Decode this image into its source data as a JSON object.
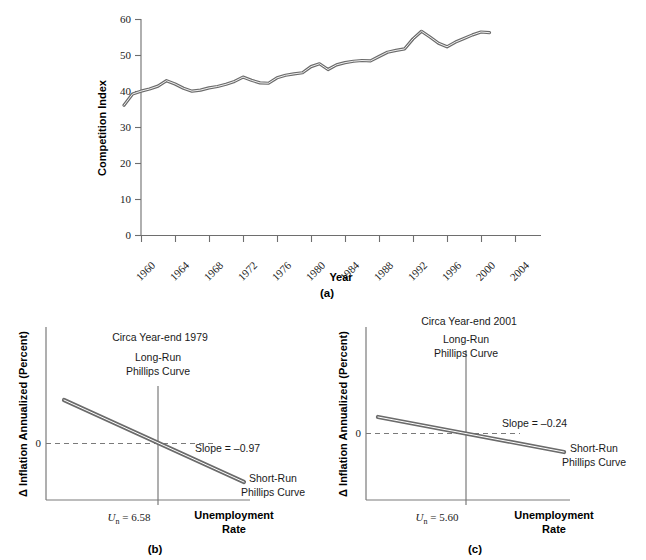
{
  "figure": {
    "panels": [
      {
        "id": "a",
        "label": "(a)"
      },
      {
        "id": "b",
        "label": "(b)"
      },
      {
        "id": "c",
        "label": "(c)"
      }
    ]
  },
  "chart_data": [
    {
      "type": "line",
      "panel": "(a)",
      "title": "",
      "xlabel": "Year",
      "ylabel": "Competition Index",
      "xlim": [
        1958,
        2004
      ],
      "ylim": [
        0,
        60
      ],
      "grid": false,
      "legend": "none",
      "ytick_labels": [
        "0",
        "10",
        "20",
        "30",
        "40",
        "50",
        "60"
      ],
      "yticks": [
        0,
        10,
        20,
        30,
        40,
        50,
        60
      ],
      "xtick_labels": [
        "1960",
        "1964",
        "1968",
        "1972",
        "1976",
        "1980",
        "1984",
        "1988",
        "1992",
        "1996",
        "2000",
        "2004"
      ],
      "xticks": [
        1960,
        1964,
        1968,
        1972,
        1976,
        1980,
        1984,
        1988,
        1992,
        1996,
        2000,
        2004
      ],
      "series": [
        {
          "name": "Competition Index",
          "color": "#6b6b6b",
          "x": [
            1958,
            1959,
            1960,
            1961,
            1962,
            1963,
            1964,
            1965,
            1966,
            1967,
            1968,
            1969,
            1970,
            1971,
            1972,
            1973,
            1974,
            1975,
            1976,
            1977,
            1978,
            1979,
            1980,
            1981,
            1982,
            1983,
            1984,
            1985,
            1986,
            1987,
            1988,
            1989,
            1990,
            1991,
            1992,
            1993,
            1994,
            1995,
            1996,
            1997,
            1998,
            1999,
            2000,
            2001
          ],
          "values": [
            36.1,
            39.2,
            40.0,
            40.6,
            41.4,
            42.9,
            42.0,
            40.8,
            40.0,
            40.3,
            40.9,
            41.3,
            41.9,
            42.7,
            43.9,
            43.0,
            42.3,
            42.2,
            43.7,
            44.4,
            44.8,
            45.1,
            46.8,
            47.6,
            46.0,
            47.3,
            47.9,
            48.3,
            48.5,
            48.4,
            49.6,
            50.8,
            51.3,
            51.7,
            54.5,
            56.6,
            55.0,
            53.3,
            52.3,
            53.6,
            54.6,
            55.6,
            56.4,
            56.2
          ]
        }
      ]
    },
    {
      "type": "line",
      "panel": "(b)",
      "title": "Circa Year-end 1979",
      "xlabel": "Unemployment Rate",
      "ylabel": "Δ Inflation Annualized (Percent)",
      "grid": false,
      "zero_label": "0",
      "lrpc_label_line1": "Long-Run",
      "lrpc_label_line2": "Phillips Curve",
      "srpc_label_line1": "Short-Run",
      "srpc_label_line2": "Phillips Curve",
      "slope_label": "Slope = –0.97",
      "slope_value": -0.97,
      "natural_rate_label": "U",
      "natural_rate_sub": "n",
      "natural_rate_eq": " = 6.58",
      "natural_rate_value": 6.58
    },
    {
      "type": "line",
      "panel": "(c)",
      "title": "Circa Year-end 2001",
      "xlabel": "Unemployment Rate",
      "ylabel": "Δ Inflation Annualized (Percent)",
      "grid": false,
      "zero_label": "0",
      "lrpc_label_line1": "Long-Run",
      "lrpc_label_line2": "Phillips Curve",
      "srpc_label_line1": "Short-Run",
      "srpc_label_line2": "Phillips Curve",
      "slope_label": "Slope = –0.24",
      "slope_value": -0.24,
      "natural_rate_label": "U",
      "natural_rate_sub": "n",
      "natural_rate_eq": " = 5.60",
      "natural_rate_value": 5.6
    }
  ],
  "panel_a": {
    "ylabel": "Competition Index",
    "xlabel": "Year",
    "caption": "(a)",
    "ytick_labels": [
      "60",
      "50",
      "40",
      "30",
      "20",
      "10",
      "0"
    ],
    "xtick_labels": [
      "1960",
      "1964",
      "1968",
      "1972",
      "1976",
      "1980",
      "1984",
      "1988",
      "1992",
      "1996",
      "2000",
      "2004"
    ]
  },
  "panel_b": {
    "ylabel": "Δ Inflation Annualized (Percent)",
    "xlabel_line1": "Unemployment",
    "xlabel_line2": "Rate",
    "caption": "(b)",
    "circa": "Circa Year-end 1979",
    "lrpc_line1": "Long-Run",
    "lrpc_line2": "Phillips Curve",
    "srpc_line1": "Short-Run",
    "srpc_line2": "Phillips Curve",
    "slope": "Slope = –0.97",
    "zero": "0",
    "un_u": "U",
    "un_sub": "n",
    "un_val": " = 6.58"
  },
  "panel_c": {
    "ylabel": "Δ Inflation Annualized (Percent)",
    "xlabel_line1": "Unemployment",
    "xlabel_line2": "Rate",
    "caption": "(c)",
    "circa": "Circa Year-end 2001",
    "lrpc_line1": "Long-Run",
    "lrpc_line2": "Phillips Curve",
    "srpc_line1": "Short-Run",
    "srpc_line2": "Phillips Curve",
    "slope": "Slope = –0.24",
    "zero": "0",
    "un_u": "U",
    "un_sub": "n",
    "un_val": " = 5.60"
  },
  "colors": {
    "line": "#6b6b6b",
    "axis": "#6e6e6e",
    "text": "#1a1a1a",
    "background": "#ffffff"
  }
}
